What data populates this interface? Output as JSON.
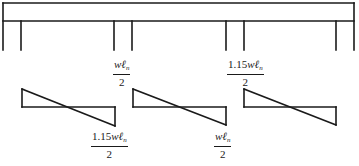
{
  "diagram": {
    "beam": {
      "left": 3,
      "right": 354,
      "top": 3,
      "bottom": 21
    },
    "columns_x": [
      3,
      21,
      114,
      132,
      226,
      244,
      336,
      354
    ],
    "column_bottom": 50,
    "stroke_color": "#1a1a1a",
    "spans": [
      {
        "name": "span-1",
        "x1": 22,
        "x2": 115,
        "base_y": 107,
        "left_shear_y": 89,
        "right_shear_y": 126
      },
      {
        "name": "span-2",
        "x1": 133,
        "x2": 226,
        "base_y": 107,
        "left_shear_y": 89,
        "right_shear_y": 125
      },
      {
        "name": "span-3",
        "x1": 244,
        "x2": 336,
        "base_y": 107,
        "left_shear_y": 89,
        "right_shear_y": 125
      }
    ],
    "labels": [
      {
        "name": "span-2-left-shear",
        "coef": "",
        "w": "w",
        "l": "ℓ",
        "sub": "n",
        "den": "2"
      },
      {
        "name": "span-3-left-shear",
        "coef": "1.15",
        "w": "w",
        "l": "ℓ",
        "sub": "n",
        "den": "2"
      },
      {
        "name": "span-1-right-shear",
        "coef": "1.15",
        "w": "w",
        "l": "ℓ",
        "sub": "n",
        "den": "2"
      },
      {
        "name": "span-2-right-shear",
        "coef": "",
        "w": "w",
        "l": "ℓ",
        "sub": "n",
        "den": "2"
      }
    ]
  }
}
